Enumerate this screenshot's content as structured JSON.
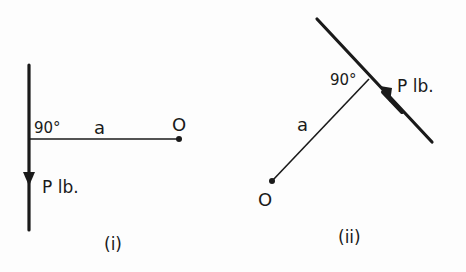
{
  "diagram_i": {
    "angle_label": "90°",
    "length_label": "a",
    "point_label": "O",
    "force_label": "P lb.",
    "caption": "(i)"
  },
  "diagram_ii": {
    "angle_label": "90°",
    "length_label": "a",
    "point_label": "O",
    "force_label": "P lb.",
    "caption": "(ii)"
  },
  "colors": {
    "ink": "#1a1a1a",
    "background": "#fdfdfd"
  }
}
